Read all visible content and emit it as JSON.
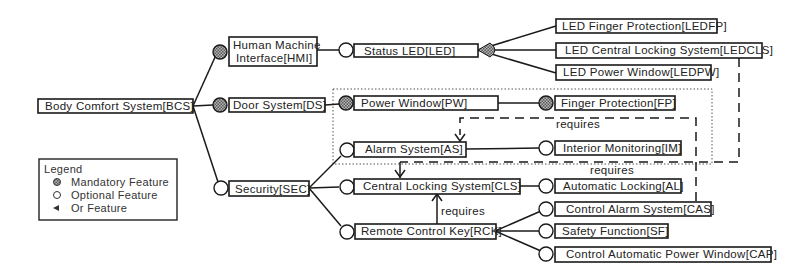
{
  "colors": {
    "line": "#1a1a1a",
    "mandatory_fill": "#8a8a8a",
    "optional_fill": "#ffffff",
    "background": "#ffffff"
  },
  "features": {
    "bcs": {
      "label": "Body Comfort System[BCS]",
      "kind": "root"
    },
    "hmi": {
      "label_line1": "Human Machine",
      "label_line2": "Interface[HMI]",
      "kind": "mandatory"
    },
    "ds": {
      "label": "Door System[DS]",
      "kind": "mandatory"
    },
    "sec": {
      "label": "Security[SEC]",
      "kind": "optional"
    },
    "led": {
      "label": "Status LED[LED]",
      "kind": "optional"
    },
    "ledfp": {
      "label": "LED Finger Protection[LEDFP]",
      "kind": "or"
    },
    "ledcls": {
      "label": "LED Central Locking System[LEDCLS]",
      "kind": "or"
    },
    "ledpw": {
      "label": "LED Power Window[LEDPW]",
      "kind": "or"
    },
    "pw": {
      "label": "Power Window[PW]",
      "kind": "mandatory"
    },
    "fp": {
      "label": "Finger Protection[FP]",
      "kind": "mandatory"
    },
    "as": {
      "label": "Alarm System[AS]",
      "kind": "optional"
    },
    "im": {
      "label": "Interior Monitoring[IM]",
      "kind": "optional"
    },
    "cls": {
      "label": "Central Locking System[CLS]",
      "kind": "optional"
    },
    "al": {
      "label": "Automatic Locking[AL]",
      "kind": "optional"
    },
    "rck": {
      "label": "Remote Control Key[RCK]",
      "kind": "optional"
    },
    "cas": {
      "label": "Control Alarm System[CAS]",
      "kind": "optional"
    },
    "sf": {
      "label": "Safety Function[SF]",
      "kind": "optional"
    },
    "cap": {
      "label": "Control Automatic Power Window[CAP]",
      "kind": "optional"
    }
  },
  "constraints": [
    {
      "from": "ledcls",
      "to": "cls",
      "label": "requires"
    },
    {
      "from": "cas",
      "to": "as",
      "label": "requires"
    },
    {
      "from": "rck",
      "to": "cls",
      "label": "requires"
    }
  ],
  "legend": {
    "title": "Legend",
    "items": [
      {
        "symbol": "mandatory",
        "label": "Mandatory Feature"
      },
      {
        "symbol": "optional",
        "label": "Optional Feature"
      },
      {
        "symbol": "or",
        "label": "Or Feature"
      }
    ]
  }
}
